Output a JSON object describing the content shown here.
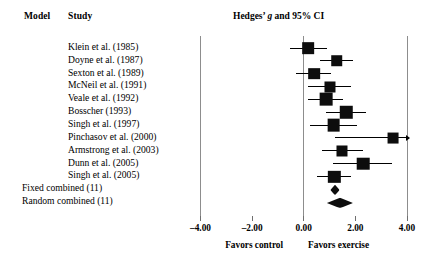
{
  "header": {
    "model_column": "Model",
    "study_column": "Study",
    "plot_title_prefix": "Hedges’ ",
    "plot_title_italic": "g",
    "plot_title_suffix": " and 95% CI"
  },
  "axis": {
    "ticks": [
      "–4.00",
      "–2.00",
      "0.00",
      "2.00",
      "4.00"
    ],
    "tick_values": [
      -4,
      -2,
      0,
      2,
      4
    ],
    "left_footer": "Favors control",
    "right_footer": "Favors exercise",
    "xmin": -4,
    "xmax": 4
  },
  "chart_data": {
    "type": "forest",
    "title": "Hedges’ g and 95% CI",
    "xlabel": "",
    "ylabel": "",
    "xlim": [
      -4,
      4
    ],
    "xticks": [
      -4,
      -2,
      0,
      2,
      4
    ],
    "xticklabels": [
      "–4.00",
      "–2.00",
      "0.00",
      "2.00",
      "4.00"
    ],
    "grid": false,
    "legend": "none",
    "left_annotation": "Favors control",
    "right_annotation": "Favors exercise",
    "null_line": 0,
    "studies": [
      {
        "label": "Klein et al. (1985)",
        "g": 0.17,
        "ci_low": -0.55,
        "ci_high": 0.9,
        "weight": 0.72,
        "truncated_right": false
      },
      {
        "label": "Doyne et al. (1987)",
        "g": 1.28,
        "ci_low": 0.64,
        "ci_high": 1.92,
        "weight": 0.7,
        "truncated_right": false
      },
      {
        "label": "Sexton et al. (1989)",
        "g": 0.4,
        "ci_low": -0.3,
        "ci_high": 1.05,
        "weight": 0.72,
        "truncated_right": false
      },
      {
        "label": "McNeil et al. (1991)",
        "g": 1.0,
        "ci_low": 0.16,
        "ci_high": 1.85,
        "weight": 0.62,
        "truncated_right": false
      },
      {
        "label": "Veale et al. (1992)",
        "g": 0.86,
        "ci_low": 0.18,
        "ci_high": 1.54,
        "weight": 0.88,
        "truncated_right": false
      },
      {
        "label": "Bosscher  (1993)",
        "g": 1.64,
        "ci_low": 0.86,
        "ci_high": 2.41,
        "weight": 0.84,
        "truncated_right": false
      },
      {
        "label": "Singh et al. (1997)",
        "g": 1.16,
        "ci_low": 0.26,
        "ci_high": 2.05,
        "weight": 0.88,
        "truncated_right": false
      },
      {
        "label": "Pinchasov et al. (2000)",
        "g": 3.45,
        "ci_low": 1.2,
        "ci_high": 4.0,
        "weight": 0.6,
        "truncated_right": true
      },
      {
        "label": "Armstrong et al. (2003)",
        "g": 1.5,
        "ci_low": 0.71,
        "ci_high": 2.31,
        "weight": 0.62,
        "truncated_right": false
      },
      {
        "label": "Dunn et al. (2005)",
        "g": 2.3,
        "ci_low": 1.14,
        "ci_high": 3.42,
        "weight": 0.86,
        "truncated_right": false
      },
      {
        "label": "Singh et al. (2005)",
        "g": 1.18,
        "ci_low": 0.5,
        "ci_high": 1.84,
        "weight": 0.82,
        "truncated_right": false
      }
    ],
    "summaries": [
      {
        "model": "Fixed combined (11)",
        "g": 1.2,
        "ci_low": 1.02,
        "ci_high": 1.38
      },
      {
        "model": "Random combined (11)",
        "g": 1.4,
        "ci_low": 0.9,
        "ci_high": 1.92
      }
    ]
  }
}
